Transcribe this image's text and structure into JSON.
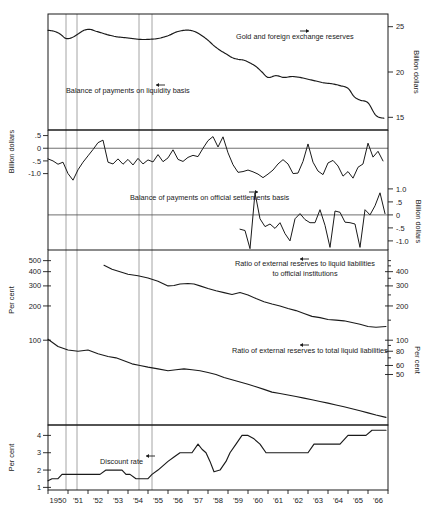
{
  "chart_data": {
    "type": "line",
    "title": "",
    "xlabel": "",
    "x_tick_labels": [
      "1950",
      "'51",
      "'52",
      "'53",
      "'54",
      "'55",
      "'56",
      "'57",
      "'58",
      "'59",
      "'60",
      "'61",
      "'62",
      "'63",
      "'64",
      "'65",
      "'66"
    ],
    "x_range": [
      1950,
      1967
    ],
    "recession_markers": [
      1950.9,
      1951.45,
      1954.55,
      1955.2
    ],
    "panels": [
      {
        "id": "reserves",
        "left_axis_label": "",
        "right_axis_label": "Billion dollars",
        "right_ticks": [
          25,
          20,
          15
        ],
        "ylim_right": [
          13.6,
          26.4
        ],
        "series": [
          {
            "name": "Gold and foreign exchange reserves",
            "label": "Gold and foreign exchange reserves",
            "arrow": "right",
            "axis": "right",
            "x": [
              1950.0,
              1950.3,
              1950.6,
              1950.9,
              1951.2,
              1951.5,
              1951.8,
              1952.1,
              1952.4,
              1952.7,
              1953.0,
              1953.4,
              1953.8,
              1954.2,
              1954.6,
              1955.0,
              1955.5,
              1956.0,
              1956.4,
              1956.8,
              1957.1,
              1957.4,
              1957.7,
              1958.0,
              1958.3,
              1958.6,
              1958.9,
              1959.2,
              1959.5,
              1959.8,
              1960.1,
              1960.4,
              1960.7,
              1961.0,
              1961.4,
              1961.8,
              1962.2,
              1962.6,
              1963.0,
              1963.4,
              1963.8,
              1964.2,
              1964.6,
              1965.0,
              1965.3,
              1965.6,
              1966.0,
              1966.4,
              1966.8
            ],
            "y": [
              24.6,
              24.5,
              24.2,
              23.7,
              23.8,
              24.2,
              24.6,
              24.7,
              24.5,
              24.3,
              24.1,
              23.9,
              23.8,
              23.7,
              23.6,
              23.6,
              23.7,
              24.0,
              24.4,
              24.6,
              24.6,
              24.4,
              24.0,
              23.5,
              22.9,
              22.4,
              22.0,
              21.6,
              21.4,
              21.3,
              21.0,
              20.6,
              20.0,
              19.4,
              19.6,
              19.4,
              19.5,
              19.4,
              19.2,
              19.0,
              18.8,
              18.7,
              18.5,
              18.2,
              17.3,
              16.9,
              16.6,
              15.2,
              14.9
            ]
          }
        ]
      },
      {
        "id": "liquidity",
        "left_axis_label": "Billion dollars",
        "left_ticks": [
          ".5",
          "0",
          "-.5",
          "-1.0"
        ],
        "left_tick_values": [
          0.5,
          0.0,
          -0.5,
          -1.0
        ],
        "ylim_left": [
          -1.45,
          0.72
        ],
        "zero_line": 0,
        "series": [
          {
            "name": "Balance of payments on liquidity basis",
            "label": "Balance of payments on liquidity basis",
            "arrow": "left",
            "axis": "left",
            "x": [
              1950.0,
              1950.25,
              1950.5,
              1950.75,
              1951.0,
              1951.25,
              1951.5,
              1951.75,
              1952.0,
              1952.25,
              1952.5,
              1952.75,
              1953.0,
              1953.25,
              1953.5,
              1953.75,
              1954.0,
              1954.25,
              1954.5,
              1954.75,
              1955.0,
              1955.25,
              1955.5,
              1955.75,
              1956.0,
              1956.25,
              1956.5,
              1956.75,
              1957.0,
              1957.25,
              1957.5,
              1957.75,
              1958.0,
              1958.25,
              1958.5,
              1958.75,
              1959.0,
              1959.25,
              1959.5,
              1959.75,
              1960.0,
              1960.25,
              1960.5,
              1960.75,
              1961.0,
              1961.25,
              1961.5,
              1961.75,
              1962.0,
              1962.25,
              1962.5,
              1962.75,
              1963.0,
              1963.25,
              1963.5,
              1963.75,
              1964.0,
              1964.25,
              1964.5,
              1964.75,
              1965.0,
              1965.25,
              1965.5,
              1965.75,
              1966.0,
              1966.25,
              1966.5,
              1966.75
            ],
            "y": [
              -0.42,
              -0.5,
              -0.63,
              -0.55,
              -1.0,
              -1.26,
              -0.85,
              -0.55,
              -0.3,
              -0.05,
              0.22,
              0.32,
              -0.55,
              -0.62,
              -0.42,
              -0.63,
              -0.44,
              -0.66,
              -0.4,
              -0.62,
              -0.46,
              -0.54,
              -0.25,
              -0.53,
              -0.38,
              -0.06,
              -0.44,
              -0.52,
              -0.36,
              -0.28,
              -0.33,
              0.0,
              0.3,
              0.46,
              0.05,
              0.45,
              -0.18,
              -0.65,
              -0.95,
              -0.92,
              -0.86,
              -0.93,
              -1.02,
              -1.16,
              -1.02,
              -0.86,
              -0.62,
              -0.45,
              -0.62,
              -1.0,
              -0.98,
              -0.52,
              0.17,
              -0.55,
              -0.9,
              -1.04,
              -0.58,
              -0.48,
              -0.7,
              -1.1,
              -0.92,
              -1.18,
              -0.75,
              -0.62,
              0.2,
              -0.35,
              -0.12,
              -0.5
            ]
          }
        ]
      },
      {
        "id": "official",
        "right_axis_label": "Billion dollars",
        "right_ticks": [
          "1.0",
          ".5",
          "0",
          "-.5",
          "-1.0"
        ],
        "right_tick_values": [
          1.0,
          0.5,
          0.0,
          -0.5,
          -1.0
        ],
        "ylim_right": [
          -1.35,
          1.15
        ],
        "zero_line": 0,
        "series": [
          {
            "name": "Balance of payments on official settlements basis",
            "label": "Balance of payments on official settlements basis",
            "arrow": "right",
            "axis": "right",
            "x": [
              1959.6,
              1959.85,
              1960.1,
              1960.35,
              1960.6,
              1960.85,
              1961.1,
              1961.35,
              1961.6,
              1961.85,
              1962.1,
              1962.35,
              1962.6,
              1962.85,
              1963.1,
              1963.35,
              1963.6,
              1963.85,
              1964.1,
              1964.35,
              1964.6,
              1964.85,
              1965.1,
              1965.35,
              1965.6,
              1965.85,
              1966.1,
              1966.35,
              1966.6,
              1966.85
            ],
            "y": [
              -0.55,
              -0.6,
              -1.3,
              0.85,
              -0.15,
              -0.45,
              -0.35,
              -0.52,
              -0.3,
              -0.72,
              -1.0,
              -0.15,
              0.05,
              -0.18,
              -0.3,
              -0.3,
              0.2,
              -0.4,
              -1.25,
              0.15,
              0.1,
              -0.28,
              -0.3,
              -0.35,
              -1.25,
              0.2,
              0.0,
              0.35,
              0.85,
              0.05
            ]
          }
        ]
      },
      {
        "id": "ratios",
        "left_axis_label": "Per cent",
        "left_ticks": [
          "500",
          "400",
          "300",
          "200",
          "100"
        ],
        "left_tick_values": [
          500,
          400,
          300,
          200,
          100
        ],
        "right_axis_label": "Per cent",
        "right_ticks": [
          "400",
          "300",
          "200",
          "100",
          "80",
          "60",
          "50"
        ],
        "right_tick_values": [
          400,
          300,
          200,
          100,
          80,
          60,
          50
        ],
        "scale": "log",
        "series": [
          {
            "name": "Ratio of external reserves to liquid liabilities to official institutions",
            "label_line1": "Ratio of external reserves to liquid liabilities",
            "label_line2": "to official institutions",
            "arrow": "left",
            "axis": "left",
            "x": [
              1952.8,
              1953.2,
              1953.6,
              1954.0,
              1954.5,
              1955.0,
              1955.5,
              1956.0,
              1956.3,
              1956.6,
              1957.0,
              1957.3,
              1957.6,
              1958.0,
              1958.4,
              1958.8,
              1959.2,
              1959.6,
              1960.0,
              1960.4,
              1960.8,
              1961.2,
              1961.6,
              1962.0,
              1962.4,
              1962.8,
              1963.2,
              1963.6,
              1964.0,
              1964.4,
              1964.8,
              1965.2,
              1965.6,
              1966.0,
              1966.4,
              1966.9
            ],
            "y": [
              455,
              420,
              400,
              380,
              368,
              352,
              330,
              300,
              302,
              312,
              315,
              312,
              300,
              285,
              272,
              262,
              252,
              262,
              250,
              232,
              218,
              208,
              200,
              190,
              182,
              172,
              162,
              158,
              152,
              150,
              148,
              143,
              138,
              132,
              130,
              132
            ]
          },
          {
            "name": "Ratio of external reserves to total liquid liabilities",
            "label": "Ratio of external reserves to total liquid liabilities",
            "arrow": "left",
            "axis": "left",
            "x": [
              1950.0,
              1950.5,
              1951.0,
              1951.5,
              1952.0,
              1952.5,
              1953.0,
              1953.4,
              1953.8,
              1954.2,
              1954.6,
              1955.0,
              1955.5,
              1956.0,
              1956.4,
              1956.8,
              1957.2,
              1957.6,
              1958.0,
              1958.4,
              1958.8,
              1959.2,
              1959.6,
              1960.0,
              1960.4,
              1960.8,
              1961.2,
              1961.6,
              1962.0,
              1962.4,
              1962.8,
              1963.2,
              1963.6,
              1964.0,
              1964.4,
              1964.8,
              1965.2,
              1965.6,
              1966.0,
              1966.4,
              1966.9
            ],
            "y": [
              102,
              88,
              82,
              80,
              82,
              76,
              72,
              70,
              66,
              62,
              60,
              58,
              56,
              54,
              55,
              56,
              55,
              54,
              52,
              50,
              47,
              45,
              43,
              41,
              39,
              37,
              35,
              34,
              33,
              32,
              31,
              30,
              29,
              28,
              27,
              26,
              25,
              24,
              23,
              22,
              21
            ]
          }
        ]
      },
      {
        "id": "discount",
        "left_axis_label": "Per cent",
        "left_ticks": [
          "4",
          "3",
          "2",
          "1"
        ],
        "left_tick_values": [
          4,
          3,
          2,
          1
        ],
        "ylim_left": [
          0.85,
          4.6
        ],
        "series": [
          {
            "name": "Discount rate",
            "label": "Discount rate",
            "arrow": "left",
            "axis": "left",
            "x": [
              1950.0,
              1950.2,
              1950.5,
              1950.7,
              1951.0,
              1952.0,
              1952.6,
              1952.9,
              1953.1,
              1953.7,
              1953.9,
              1954.1,
              1954.4,
              1954.6,
              1955.0,
              1955.2,
              1955.5,
              1955.8,
              1956.0,
              1956.3,
              1956.6,
              1957.0,
              1957.2,
              1957.5,
              1957.7,
              1957.9,
              1958.1,
              1958.3,
              1958.6,
              1958.9,
              1959.1,
              1959.4,
              1959.7,
              1960.0,
              1960.3,
              1960.6,
              1960.9,
              1961.2,
              1962.0,
              1962.8,
              1963.0,
              1963.3,
              1963.8,
              1964.2,
              1964.6,
              1965.0,
              1965.4,
              1965.9,
              1966.2,
              1966.6,
              1966.9
            ],
            "y": [
              1.38,
              1.5,
              1.5,
              1.75,
              1.75,
              1.75,
              1.75,
              2.0,
              2.0,
              2.0,
              1.75,
              1.75,
              1.5,
              1.5,
              1.5,
              1.75,
              2.0,
              2.3,
              2.5,
              2.75,
              3.0,
              3.0,
              3.0,
              3.5,
              3.2,
              3.0,
              2.5,
              1.9,
              2.0,
              2.5,
              3.0,
              3.5,
              4.0,
              4.0,
              3.8,
              3.5,
              3.0,
              3.0,
              3.0,
              3.0,
              3.0,
              3.5,
              3.5,
              3.5,
              3.5,
              4.0,
              4.0,
              4.0,
              4.3,
              4.3,
              4.3
            ]
          }
        ]
      }
    ]
  },
  "axis_text": {
    "billion_dollars": "Billion dollars",
    "per_cent": "Per cent"
  },
  "labels": {
    "gold_reserves": "Gold and foreign exchange reserves",
    "liquidity_basis": "Balance of payments on liquidity basis",
    "official_settlements": "Balance of payments on official settlements basis",
    "ratio_official_l1": "Ratio of external reserves to liquid liabilities",
    "ratio_official_l2": "to official institutions",
    "ratio_total": "Ratio of external reserves to total liquid liabilities",
    "discount_rate": "Discount rate"
  }
}
